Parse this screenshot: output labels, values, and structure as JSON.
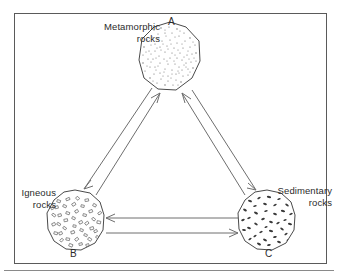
{
  "figure": {
    "border_color": "#5a5a5a",
    "background_color": "#ffffff",
    "line_color": "#6e6e6e",
    "text_color": "#2b2b2b"
  },
  "nodes": [
    {
      "id": "A",
      "marker": "A",
      "label_line1": "Metamorphic",
      "label_line2": "rocks",
      "texture": "fine-stipple",
      "cx": 170,
      "cy": 58
    },
    {
      "id": "B",
      "marker": "B",
      "label_line1": "Igneous",
      "label_line2": "rocks",
      "texture": "angular-crystals",
      "cx": 75,
      "cy": 222
    },
    {
      "id": "C",
      "marker": "C",
      "label_line1": "Sedimentary",
      "label_line2": "rocks",
      "texture": "dark-clasts",
      "cx": 267,
      "cy": 221
    }
  ],
  "arrows": [
    {
      "name": "arrow-a-to-b",
      "from": "A",
      "to": "B",
      "direction": "down-left"
    },
    {
      "name": "arrow-b-to-a",
      "from": "B",
      "to": "A",
      "direction": "up-right"
    },
    {
      "name": "arrow-a-to-c",
      "from": "A",
      "to": "C",
      "direction": "down-right"
    },
    {
      "name": "arrow-c-to-a",
      "from": "C",
      "to": "A",
      "direction": "up-left"
    },
    {
      "name": "arrow-c-to-b",
      "from": "C",
      "to": "B",
      "direction": "left"
    },
    {
      "name": "arrow-b-to-c",
      "from": "B",
      "to": "C",
      "direction": "right"
    }
  ]
}
